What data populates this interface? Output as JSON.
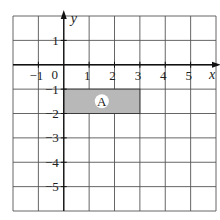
{
  "diagram": {
    "type": "coordinate-grid",
    "x_axis_label": "x",
    "y_axis_label": "y",
    "x_range": [
      -2,
      6
    ],
    "y_range": [
      -6,
      2
    ],
    "origin_label": "0",
    "x_tick_labels": [
      {
        "value": -1,
        "label": "−1"
      },
      {
        "value": 1,
        "label": "1"
      },
      {
        "value": 2,
        "label": "2"
      },
      {
        "value": 3,
        "label": "3"
      },
      {
        "value": 4,
        "label": "4"
      },
      {
        "value": 5,
        "label": "5"
      }
    ],
    "y_tick_labels": [
      {
        "value": 1,
        "label": "1"
      },
      {
        "value": -1,
        "label": "−1"
      },
      {
        "value": -2,
        "label": "−2"
      },
      {
        "value": -3,
        "label": "−3"
      },
      {
        "value": -4,
        "label": "−4"
      },
      {
        "value": -5,
        "label": "−5"
      }
    ],
    "shapes": [
      {
        "name": "A",
        "label": "A",
        "x1": 0,
        "y1": -1,
        "x2": 3,
        "y2": -2,
        "fill": "#b8b8b8"
      }
    ],
    "colors": {
      "grid": "#555555",
      "axis": "#111111",
      "label_circle": "#ffffff"
    }
  }
}
